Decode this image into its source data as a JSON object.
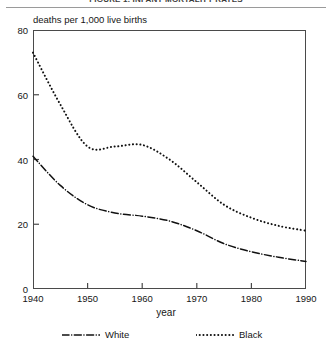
{
  "figure": {
    "title": "FIGURE 1. INFANT MORTALITY RATES",
    "y_caption": "deaths per 1,000 live births",
    "x_label": "year"
  },
  "axes": {
    "y_ticks": [
      "0",
      "20",
      "40",
      "60",
      "80"
    ],
    "x_ticks": [
      "1940",
      "1950",
      "1960",
      "1970",
      "1980",
      "1990"
    ]
  },
  "legend": {
    "position": "below-axis",
    "entries": [
      {
        "label": "White",
        "style": "dash-dot",
        "color": "#111111"
      },
      {
        "label": "Black",
        "style": "dotted",
        "color": "#111111"
      }
    ]
  },
  "chart_data": {
    "type": "line",
    "title": "FIGURE 1. INFANT MORTALITY RATES",
    "xlabel": "year",
    "ylabel": "deaths per 1,000 live births",
    "xlim": [
      1940,
      1990
    ],
    "ylim": [
      0,
      80
    ],
    "grid": false,
    "legend_position": "bottom",
    "x": [
      1940,
      1945,
      1950,
      1955,
      1960,
      1965,
      1970,
      1975,
      1980,
      1985,
      1990
    ],
    "series": [
      {
        "name": "Black",
        "style": "dotted",
        "color": "#111111",
        "values": [
          73.0,
          57.0,
          44.0,
          44.0,
          44.5,
          40.0,
          33.0,
          26.0,
          22.0,
          19.5,
          18.0
        ]
      },
      {
        "name": "White",
        "style": "dash-dot",
        "color": "#111111",
        "values": [
          41.0,
          32.0,
          26.0,
          23.5,
          22.5,
          21.0,
          18.0,
          14.0,
          11.5,
          9.8,
          8.5
        ]
      }
    ]
  }
}
